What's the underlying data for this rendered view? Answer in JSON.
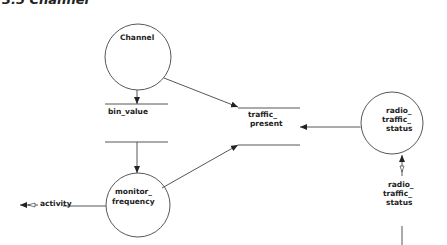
{
  "diagram": {
    "title": "3.5 Channel",
    "processes": [
      {
        "id": "channel",
        "label_lines": [
          "Channel"
        ]
      },
      {
        "id": "monitor_frequency",
        "label_lines": [
          "monitor_",
          "frequency"
        ]
      },
      {
        "id": "radio_traffic_status",
        "label_lines": [
          "radio_",
          "traffic_",
          "status"
        ]
      }
    ],
    "stores": [
      {
        "id": "bin_value",
        "label_lines": [
          "bin_value"
        ]
      },
      {
        "id": "traffic_present",
        "label_lines": [
          "traffic_",
          "present"
        ]
      }
    ],
    "flows": [
      {
        "from": "channel",
        "to": "bin_value"
      },
      {
        "from": "bin_value",
        "to": "monitor_frequency"
      },
      {
        "from": "channel",
        "to": "traffic_present"
      },
      {
        "from": "monitor_frequency",
        "to": "traffic_present"
      },
      {
        "from": "radio_traffic_status",
        "to": "traffic_present",
        "bidirectional": true
      },
      {
        "from": "external",
        "to": "radio_traffic_status",
        "label_lines": [
          "radio_",
          "traffic_",
          "status"
        ]
      },
      {
        "from": "monitor_frequency",
        "to": "external",
        "label": "activity"
      }
    ],
    "colors": {
      "line": "#444444",
      "text": "#222222",
      "background": "#ffffff"
    }
  }
}
